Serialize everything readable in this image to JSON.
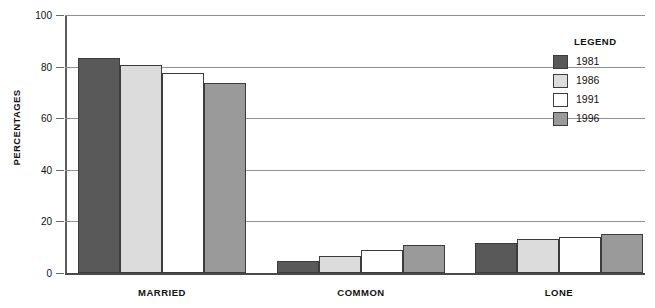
{
  "chart_data": {
    "type": "bar",
    "title": "",
    "xlabel": "",
    "ylabel": "PERCENTAGES",
    "ylim": [
      0,
      100
    ],
    "yticks": [
      0,
      20,
      40,
      60,
      80,
      100
    ],
    "grid": true,
    "legend_position": "right",
    "legend_title": "LEGEND",
    "categories": [
      "MARRIED",
      "COMMON",
      "LONE"
    ],
    "series": [
      {
        "name": "1981",
        "color": "#595959",
        "values": [
          83.5,
          4.5,
          11.5
        ]
      },
      {
        "name": "1986",
        "color": "#dcdcdc",
        "values": [
          80.5,
          6.5,
          13.0
        ]
      },
      {
        "name": "1991",
        "color": "#ffffff",
        "values": [
          77.5,
          9.0,
          14.0
        ]
      },
      {
        "name": "1996",
        "color": "#9a9a9a",
        "values": [
          73.5,
          11.0,
          15.0
        ]
      }
    ]
  },
  "axis": {
    "y_title": "PERCENTAGES",
    "tick_labels": [
      "0",
      "20",
      "40",
      "60",
      "80",
      "100"
    ]
  },
  "legend": {
    "title": "LEGEND",
    "items": [
      {
        "label": "1981",
        "color": "#595959"
      },
      {
        "label": "1986",
        "color": "#dcdcdc"
      },
      {
        "label": "1991",
        "color": "#ffffff"
      },
      {
        "label": "1996",
        "color": "#9a9a9a"
      }
    ]
  }
}
